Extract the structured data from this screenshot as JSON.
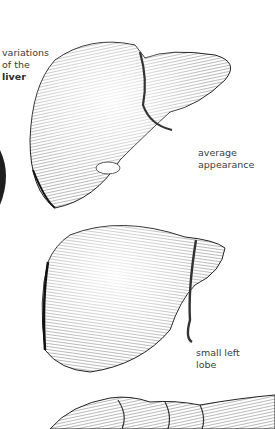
{
  "figure": {
    "title_lines": [
      "variations",
      "of the"
    ],
    "title_bold": "liver",
    "illustrations": [
      {
        "name": "liver-average",
        "caption_lines": [
          "average",
          "appearance"
        ]
      },
      {
        "name": "liver-small-left-lobe",
        "caption_lines": [
          "small left",
          "lobe"
        ]
      },
      {
        "name": "liver-third-variant",
        "caption_lines": []
      }
    ],
    "colors": {
      "ink": "#2b2b2b",
      "paper": "#ffffff",
      "text": "#3c3c3c"
    }
  }
}
